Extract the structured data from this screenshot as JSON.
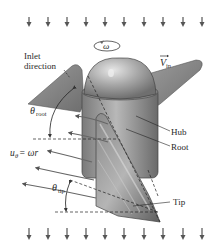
{
  "labels": {
    "omega": "ω",
    "v_in_main": "V",
    "v_in_sub": "in",
    "inlet_line1": "Inlet",
    "inlet_line2": "direction",
    "theta_root_main": "θ",
    "theta_root_sub": "root",
    "hub": "Hub",
    "root": "Root",
    "u_theta_main": "u",
    "u_theta_sub": "θ",
    "u_theta_eq": " = ωr",
    "theta_tip_main": "θ",
    "theta_tip_sub": "tip",
    "tip": "Tip"
  },
  "flow_arrows": {
    "top_y": [
      17,
      27
    ],
    "bottom_y": [
      228,
      240
    ],
    "x_positions": [
      29,
      48,
      67,
      86,
      105,
      124,
      144,
      163,
      183,
      202
    ]
  },
  "colors": {
    "arrow": "#555555",
    "body_dark": "#6d6d6d",
    "body_mid": "#9a9a9a",
    "body_light": "#cfcfcf",
    "text": "#2a2a2a"
  }
}
